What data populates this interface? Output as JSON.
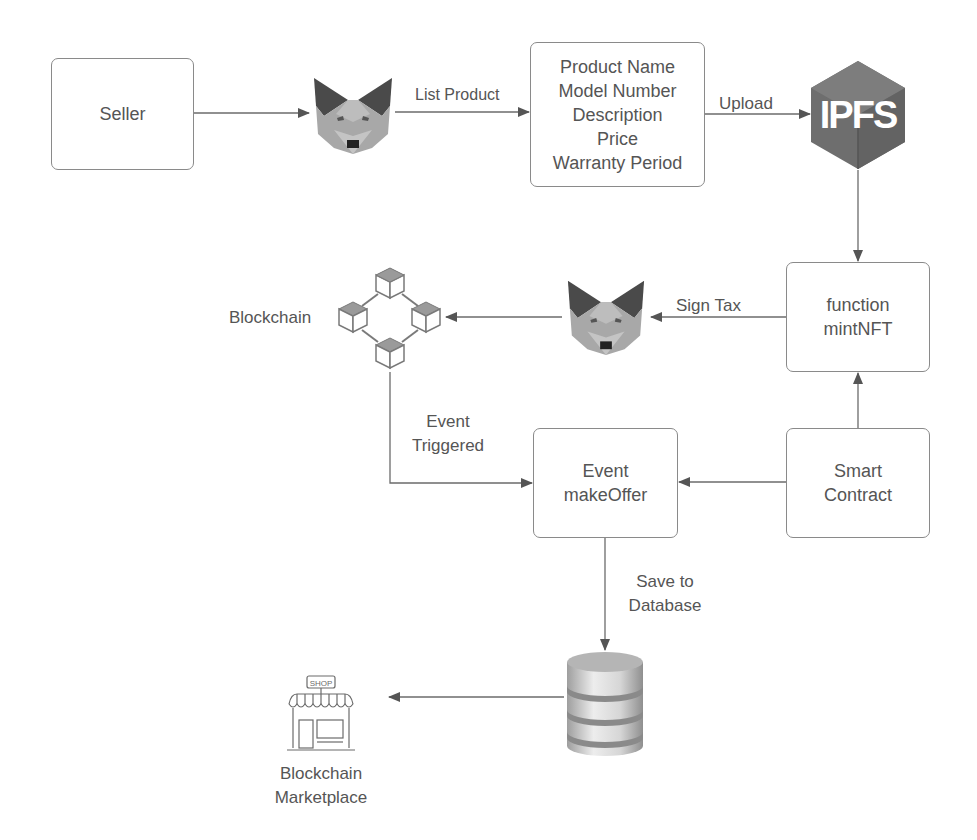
{
  "diagram": {
    "nodes": {
      "seller": {
        "label": "Seller"
      },
      "product_info": {
        "lines": [
          "Product Name",
          "Model Number",
          "Description",
          "Price",
          "Warranty Period"
        ]
      },
      "ipfs": {
        "label": "IPFS",
        "icon": "ipfs-hexagon-icon"
      },
      "mint_nft": {
        "lines": [
          "function",
          "mintNFT"
        ]
      },
      "smart_contract": {
        "lines": [
          "Smart",
          "Contract"
        ]
      },
      "make_offer": {
        "lines": [
          "Event",
          "makeOffer"
        ]
      },
      "blockchain": {
        "label": "Blockchain",
        "icon": "blockchain-cubes-icon"
      },
      "metamask_1": {
        "icon": "metamask-fox-icon"
      },
      "metamask_2": {
        "icon": "metamask-fox-icon"
      },
      "database": {
        "icon": "database-icon"
      },
      "marketplace": {
        "lines": [
          "Blockchain",
          "Marketplace"
        ],
        "icon": "shop-icon",
        "sign_text": "SHOP"
      }
    },
    "edges": {
      "seller_to_metamask": {
        "label": ""
      },
      "list_product": {
        "label": "List Product"
      },
      "upload": {
        "label": "Upload"
      },
      "ipfs_to_mint": {
        "label": ""
      },
      "sign_tax": {
        "label": "Sign Tax"
      },
      "metamask_to_blockchain": {
        "label": ""
      },
      "event_triggered": {
        "lines": [
          "Event",
          "Triggered"
        ]
      },
      "contract_to_mint": {
        "label": ""
      },
      "contract_to_offer": {
        "label": ""
      },
      "save_to_database": {
        "lines": [
          "Save to",
          "Database"
        ]
      },
      "database_to_marketplace": {
        "label": ""
      }
    },
    "colors": {
      "line": "#6b6b6b",
      "box_border": "#8a8a8a",
      "text": "#555555",
      "ipfs_hex": "#6e6e6e",
      "fox_ear": "#4a4a4a",
      "fox_face": "#a8a8a8"
    }
  }
}
